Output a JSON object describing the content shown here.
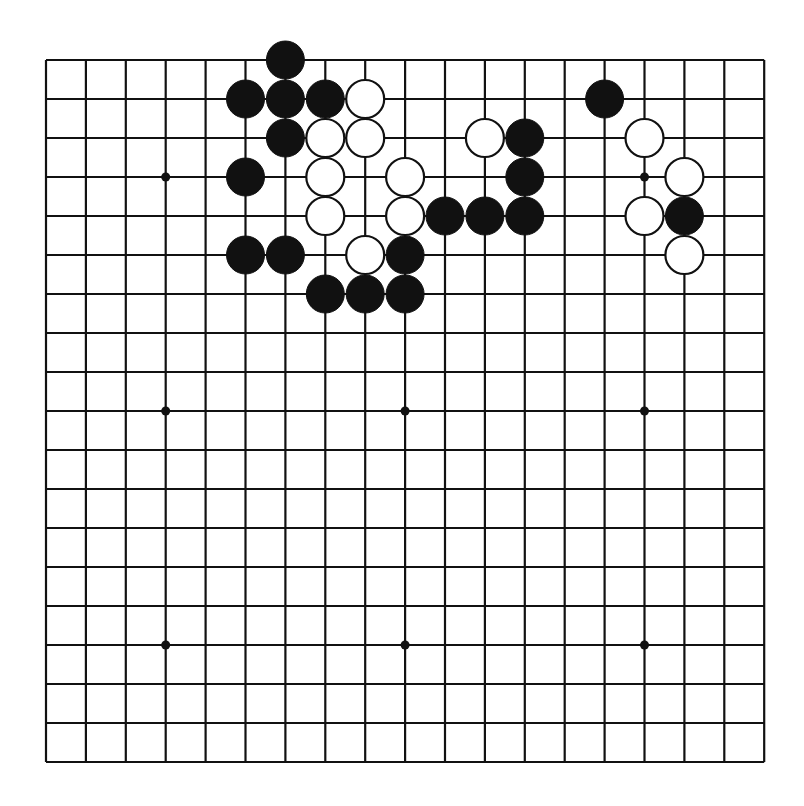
{
  "board": {
    "size": 19,
    "origin": {
      "x": 46,
      "y": 60
    },
    "spacing": {
      "x": 39.9,
      "y": 39.0
    },
    "stone_radius": 19,
    "colors": {
      "line": "#111111",
      "black": "#111111",
      "white": "#ffffff",
      "background": "#ffffff"
    },
    "star_points": [
      [
        3,
        3
      ],
      [
        9,
        3
      ],
      [
        15,
        3
      ],
      [
        3,
        9
      ],
      [
        9,
        9
      ],
      [
        15,
        9
      ],
      [
        3,
        15
      ],
      [
        9,
        15
      ],
      [
        15,
        15
      ]
    ],
    "stones": {
      "black": [
        [
          6,
          0
        ],
        [
          5,
          1
        ],
        [
          6,
          1
        ],
        [
          7,
          1
        ],
        [
          14,
          1
        ],
        [
          6,
          2
        ],
        [
          12,
          2
        ],
        [
          5,
          3
        ],
        [
          12,
          3
        ],
        [
          10,
          4
        ],
        [
          11,
          4
        ],
        [
          12,
          4
        ],
        [
          16,
          4
        ],
        [
          5,
          5
        ],
        [
          6,
          5
        ],
        [
          9,
          5
        ],
        [
          7,
          6
        ],
        [
          8,
          6
        ],
        [
          9,
          6
        ]
      ],
      "white": [
        [
          8,
          1
        ],
        [
          7,
          2
        ],
        [
          8,
          2
        ],
        [
          11,
          2
        ],
        [
          15,
          2
        ],
        [
          7,
          3
        ],
        [
          9,
          3
        ],
        [
          16,
          3
        ],
        [
          7,
          4
        ],
        [
          9,
          4
        ],
        [
          15,
          4
        ],
        [
          8,
          5
        ],
        [
          16,
          5
        ]
      ]
    }
  }
}
